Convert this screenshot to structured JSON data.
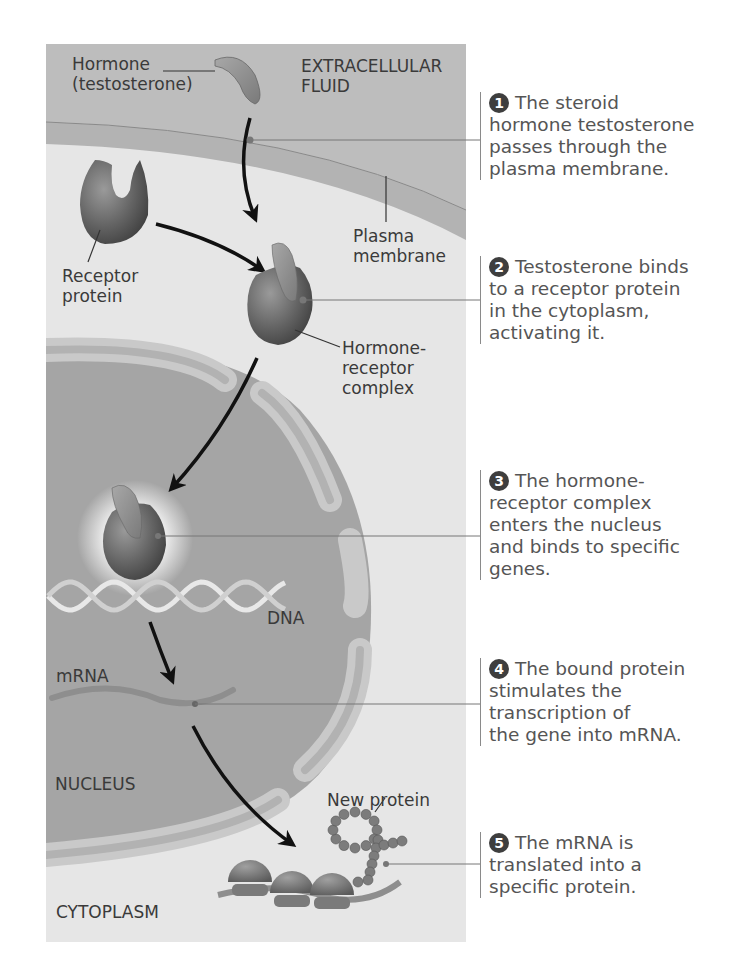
{
  "labels": {
    "hormone": "Hormone\n(testosterone)",
    "extracellular_fluid": "EXTRACELLULAR\nFLUID",
    "receptor_protein": "Receptor\nprotein",
    "plasma_membrane": "Plasma\nmembrane",
    "hormone_receptor_complex": "Hormone-\nreceptor\ncomplex",
    "dna": "DNA",
    "mrna": "mRNA",
    "nucleus": "NUCLEUS",
    "new_protein": "New protein",
    "cytoplasm": "CYTOPLASM"
  },
  "steps": [
    {
      "number": "1",
      "lines": [
        "The steroid",
        "hormone testosterone",
        "passes through the",
        "plasma membrane."
      ]
    },
    {
      "number": "2",
      "lines": [
        "Testosterone binds",
        "to a receptor protein",
        "in the cytoplasm,",
        "activating it."
      ]
    },
    {
      "number": "3",
      "lines": [
        "The hormone-",
        "receptor complex",
        "enters the nucleus",
        "and binds to specific",
        "genes."
      ]
    },
    {
      "number": "4",
      "lines": [
        "The bound protein",
        "stimulates the",
        "transcription of",
        "the gene into mRNA."
      ]
    },
    {
      "number": "5",
      "lines": [
        "The mRNA is",
        "translated into a",
        "specific protein."
      ]
    }
  ],
  "colors": {
    "extracellular": "#bdbdbd",
    "membrane": "#a9a9a9",
    "cytoplasm": "#e6e6e6",
    "nucleus": "#a5a5a5",
    "envelope": "#c9c9c9",
    "protein": "#6e6e6e",
    "arrow": "#111111"
  }
}
